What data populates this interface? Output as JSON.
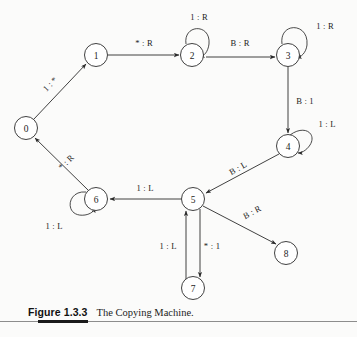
{
  "figure": {
    "number": "Figure 1.3.3",
    "title": "The Copying Machine."
  },
  "diagram": {
    "type": "state-transition-diagram",
    "states": [
      {
        "id": "0",
        "label": "0",
        "cx": 26,
        "cy": 128
      },
      {
        "id": "1",
        "label": "1",
        "cx": 96,
        "cy": 55
      },
      {
        "id": "2",
        "label": "2",
        "cx": 192,
        "cy": 55
      },
      {
        "id": "3",
        "label": "3",
        "cx": 288,
        "cy": 55
      },
      {
        "id": "4",
        "label": "4",
        "cx": 288,
        "cy": 146
      },
      {
        "id": "5",
        "label": "5",
        "cx": 193,
        "cy": 199
      },
      {
        "id": "6",
        "label": "6",
        "cx": 96,
        "cy": 199
      },
      {
        "id": "7",
        "label": "7",
        "cx": 193,
        "cy": 288
      },
      {
        "id": "8",
        "label": "8",
        "cx": 286,
        "cy": 253
      }
    ],
    "transitions": [
      {
        "from": "0",
        "to": "1",
        "label": "1 : *",
        "label_x": 50,
        "label_y": 84,
        "rotate": -46
      },
      {
        "from": "1",
        "to": "2",
        "label": "* : R",
        "label_x": 144,
        "label_y": 43,
        "rotate": 0
      },
      {
        "from": "2",
        "to": "2",
        "label": "1 : R",
        "label_x": 199,
        "label_y": 17,
        "rotate": 0,
        "self_loop": true
      },
      {
        "from": "2",
        "to": "3",
        "label": "B : R",
        "label_x": 240,
        "label_y": 43,
        "rotate": 0
      },
      {
        "from": "3",
        "to": "3",
        "label": "1 : R",
        "label_x": 325,
        "label_y": 26,
        "rotate": 0,
        "self_loop": true
      },
      {
        "from": "3",
        "to": "4",
        "label": "B : 1",
        "label_x": 305,
        "label_y": 101,
        "rotate": 0
      },
      {
        "from": "4",
        "to": "4",
        "label": "1 : L",
        "label_x": 327,
        "label_y": 124,
        "rotate": 0,
        "self_loop": true
      },
      {
        "from": "4",
        "to": "5",
        "label": "B : L",
        "label_x": 238,
        "label_y": 168,
        "rotate": -29
      },
      {
        "from": "5",
        "to": "6",
        "label": "1 : L",
        "label_x": 145,
        "label_y": 188,
        "rotate": 0
      },
      {
        "from": "6",
        "to": "6",
        "label": "1 : L",
        "label_x": 54,
        "label_y": 226,
        "rotate": 0,
        "self_loop": true
      },
      {
        "from": "6",
        "to": "0",
        "label": "* : R",
        "label_x": 66,
        "label_y": 162,
        "rotate": -44
      },
      {
        "from": "5",
        "to": "8",
        "label": "B : R",
        "label_x": 252,
        "label_y": 212,
        "rotate": -28
      },
      {
        "from": "5",
        "to": "7",
        "label": "* : 1",
        "label_x": 212,
        "label_y": 246,
        "rotate": 0
      },
      {
        "from": "7",
        "to": "5",
        "label": "1 : L",
        "label_x": 168,
        "label_y": 246,
        "rotate": 0
      }
    ],
    "colors": {
      "stroke": "#2b2b2b",
      "text": "#1b1b1b",
      "background": "#fbfbfa",
      "rule": "#1a1a1a"
    }
  }
}
